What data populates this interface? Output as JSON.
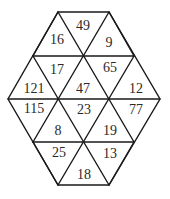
{
  "diagram": {
    "type": "hexagon-triangle-number-puzzle",
    "cells": [
      {
        "id": "r1-a",
        "value": "16",
        "x": 57,
        "y": 39
      },
      {
        "id": "r1-b",
        "value": "49",
        "x": 83,
        "y": 25
      },
      {
        "id": "r1-c",
        "value": "9",
        "x": 109,
        "y": 42
      },
      {
        "id": "r2-a",
        "value": "121",
        "x": 34,
        "y": 88
      },
      {
        "id": "r2-b",
        "value": "17",
        "x": 57,
        "y": 69
      },
      {
        "id": "r2-c",
        "value": "47",
        "x": 83,
        "y": 88
      },
      {
        "id": "r2-d",
        "value": "65",
        "x": 110,
        "y": 67
      },
      {
        "id": "r2-e",
        "value": "12",
        "x": 136,
        "y": 88
      },
      {
        "id": "r3-a",
        "value": "115",
        "x": 34,
        "y": 108
      },
      {
        "id": "r3-b",
        "value": "8",
        "x": 58,
        "y": 130
      },
      {
        "id": "r3-c",
        "value": "23",
        "x": 84,
        "y": 109
      },
      {
        "id": "r3-d",
        "value": "19",
        "x": 110,
        "y": 130
      },
      {
        "id": "r3-e",
        "value": "77",
        "x": 136,
        "y": 109
      },
      {
        "id": "r4-a",
        "value": "25",
        "x": 59,
        "y": 152
      },
      {
        "id": "r4-b",
        "value": "18",
        "x": 84,
        "y": 174
      },
      {
        "id": "r4-c",
        "value": "13",
        "x": 110,
        "y": 153
      }
    ]
  }
}
